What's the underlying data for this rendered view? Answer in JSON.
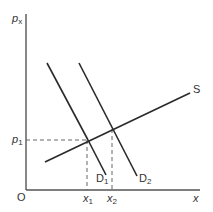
{
  "diagram": {
    "type": "supply-demand",
    "colors": {
      "line": "#2a2a2a",
      "axis": "#555555",
      "dash": "#666666",
      "text": "#333333"
    },
    "axes": {
      "y_label": "p",
      "y_label_sub": "x",
      "x_label": "x",
      "origin_label": "O"
    },
    "curves": {
      "supply": {
        "label": "S"
      },
      "demand_1": {
        "label": "D",
        "label_sub": "1"
      },
      "demand_2": {
        "label": "D",
        "label_sub": "2"
      }
    },
    "guides": {
      "price_label": "p",
      "price_label_sub": "1",
      "qty_1_label": "x",
      "qty_1_label_sub": "1",
      "qty_2_label": "x",
      "qty_2_label_sub": "2"
    }
  }
}
